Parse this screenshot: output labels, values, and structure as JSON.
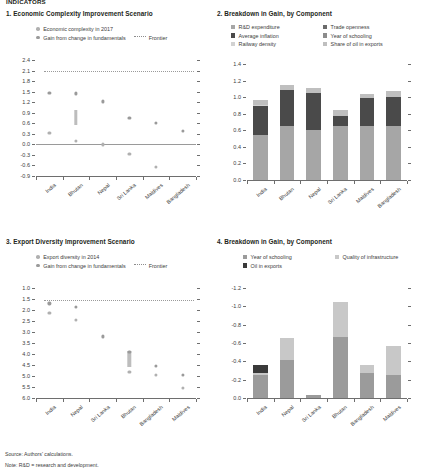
{
  "figure": {
    "top_title": "INDICATORS",
    "source": "Source: Authors' calculations.",
    "note": "Note: R&D = research and development."
  },
  "colors": {
    "complexity_dot": "#b0b0b0",
    "gain_dot": "#9a9a9a",
    "gain_bar": "#bdbdbd",
    "frontier": "#9a9a9a",
    "axis": "#6e6e6e",
    "text": "#3c3c3c",
    "rd_expenditure": "#a6a6a6",
    "average_inflation": "#4a4a4a",
    "railway_density": "#d2d2d2",
    "trade_openness": "#6b6b6b",
    "year_of_schooling": "#8c8c8c",
    "share_of_oil_in_exports": "#bfbfbf",
    "p4_year_of_schooling": "#9b9b9b",
    "p4_quality_of_infrastructure": "#c8c8c8",
    "p4_oil_in_exports": "#3a3a3a"
  },
  "panel1": {
    "title": "1. Economic Complexity Improvement Scenario",
    "legend": [
      {
        "label": "Economic complexity in 2017",
        "marker": "dot"
      },
      {
        "label": "Gain from change in fundamentals",
        "marker": "dot"
      },
      {
        "label": "Frontier",
        "marker": "dashed-line"
      }
    ],
    "chart_data": {
      "type": "scatter",
      "title": "1. Economic Complexity Improvement Scenario",
      "xlabel": "",
      "ylabel": "",
      "ylim": [
        -0.9,
        2.4
      ],
      "yticks": [
        "2.4",
        "2.1",
        "1.8",
        "1.5",
        "1.2",
        "0.9",
        "0.6",
        "0.3",
        "0.0",
        "-0.3",
        "-0.6",
        "-0.9"
      ],
      "grid": false,
      "frontier_value": 2.1,
      "categories": [
        "India",
        "Bhutan",
        "Nepal",
        "Sri Lanka",
        "Maldives",
        "Bangladesh"
      ],
      "series": [
        {
          "name": "Economic complexity in 2017",
          "values": [
            0.32,
            0.1,
            0.0,
            -0.27,
            -0.65,
            null
          ]
        },
        {
          "name": "Gain from change in fundamentals",
          "values": [
            1.47,
            1.45,
            1.22,
            0.75,
            0.6,
            0.38
          ]
        }
      ],
      "gain_range_bars": [
        {
          "category": "Bhutan",
          "low": 0.55,
          "high": 0.97
        }
      ]
    }
  },
  "panel2": {
    "title": "2. Breakdown in Gain, by Component",
    "legend": [
      {
        "label": "R&D expenditure",
        "color_key": "rd_expenditure"
      },
      {
        "label": "Trade openness",
        "color_key": "trade_openness"
      },
      {
        "label": "Average inflation",
        "color_key": "average_inflation"
      },
      {
        "label": "Year of schooling",
        "color_key": "year_of_schooling"
      },
      {
        "label": "Railway density",
        "color_key": "railway_density"
      },
      {
        "label": "Share of oil in exports",
        "color_key": "share_of_oil_in_exports"
      }
    ],
    "chart_data": {
      "type": "bar",
      "title": "2. Breakdown in Gain, by Component",
      "stacked": true,
      "xlabel": "",
      "ylabel": "",
      "ylim": [
        0.0,
        1.4
      ],
      "yticks": [
        "1.4",
        "1.2",
        "1.0",
        "0.8",
        "0.6",
        "0.4",
        "0.2",
        "0.0"
      ],
      "grid": false,
      "categories": [
        "India",
        "Bhutan",
        "Nepal",
        "Sri Lanka",
        "Maldives",
        "Bangladesh"
      ],
      "series": [
        {
          "name": "R&D expenditure",
          "color_key": "rd_expenditure",
          "values": [
            0.545,
            0.65,
            0.605,
            0.65,
            0.65,
            0.655
          ]
        },
        {
          "name": "Average inflation",
          "color_key": "average_inflation",
          "values": [
            0.345,
            0.44,
            0.45,
            0.125,
            0.335,
            0.345
          ]
        },
        {
          "name": "Railway density",
          "color_key": "railway_density",
          "values": [
            0.02,
            0.0,
            0.0,
            0.0,
            0.0,
            0.0
          ]
        },
        {
          "name": "Trade openness",
          "color_key": "trade_openness",
          "values": [
            0.0,
            0.0,
            0.0,
            0.0,
            0.0,
            0.0
          ]
        },
        {
          "name": "Year of schooling",
          "color_key": "year_of_schooling",
          "values": [
            0.0,
            0.0,
            0.0,
            0.0,
            0.0,
            0.0
          ]
        },
        {
          "name": "Share of oil in exports",
          "color_key": "share_of_oil_in_exports",
          "values": [
            0.06,
            0.06,
            0.055,
            0.065,
            0.055,
            0.07
          ]
        }
      ],
      "totals": [
        0.97,
        1.15,
        1.11,
        0.84,
        1.04,
        1.07
      ]
    }
  },
  "panel3": {
    "title": "3. Export Diversity Improvement Scenario",
    "legend": [
      {
        "label": "Export diversity in 2014",
        "marker": "dot"
      },
      {
        "label": "Gain from change in fundamentals",
        "marker": "dot"
      },
      {
        "label": "Frontier",
        "marker": "dashed-line"
      }
    ],
    "chart_data": {
      "type": "scatter",
      "title": "3. Export Diversity Improvement Scenario",
      "xlabel": "",
      "ylabel": "",
      "ylim": [
        1.0,
        6.0
      ],
      "y_inverted": true,
      "yticks": [
        "1.0",
        "1.5",
        "2.0",
        "2.5",
        "3.0",
        "3.5",
        "4.0",
        "4.5",
        "5.0",
        "5.5",
        "6.0"
      ],
      "grid": false,
      "frontier_value": 1.55,
      "categories": [
        "India",
        "Nepal",
        "Sri Lanka",
        "Bhutan",
        "Bangladesh",
        "Maldives"
      ],
      "series": [
        {
          "name": "Export diversity in 2014",
          "values": [
            2.15,
            2.45,
            null,
            4.8,
            4.95,
            5.55
          ]
        },
        {
          "name": "Gain from change in fundamentals",
          "values": [
            1.7,
            1.85,
            3.2,
            3.9,
            4.55,
            4.95
          ]
        }
      ],
      "gain_range_bars": [
        {
          "category": "Bhutan",
          "low": 3.85,
          "high": 4.6
        }
      ]
    }
  },
  "panel4": {
    "title": "4. Breakdown in Gain, by Component",
    "legend": [
      {
        "label": "Year of schooling",
        "color_key": "p4_year_of_schooling"
      },
      {
        "label": "Quality of infrastructure",
        "color_key": "p4_quality_of_infrastructure"
      },
      {
        "label": "Oil in exports",
        "color_key": "p4_oil_in_exports"
      }
    ],
    "chart_data": {
      "type": "bar",
      "title": "4. Breakdown in Gain, by Component",
      "stacked": true,
      "xlabel": "",
      "ylabel": "",
      "ylim": [
        -1.2,
        0.0
      ],
      "y_inverted": true,
      "yticks": [
        "-1.2",
        "-1.0",
        "-0.8",
        "-0.6",
        "-0.4",
        "-0.2",
        "0.0"
      ],
      "grid": false,
      "categories": [
        "India",
        "Nepal",
        "Sri Lanka",
        "Bhutan",
        "Bangladesh",
        "Maldives"
      ],
      "series": [
        {
          "name": "Year of schooling",
          "color_key": "p4_year_of_schooling",
          "values": [
            -0.255,
            -0.415,
            -0.03,
            -0.665,
            -0.27,
            -0.255
          ]
        },
        {
          "name": "Quality of infrastructure",
          "color_key": "p4_quality_of_infrastructure",
          "values": [
            -0.02,
            -0.24,
            0.0,
            -0.38,
            -0.085,
            -0.315
          ]
        },
        {
          "name": "Oil in exports",
          "color_key": "p4_oil_in_exports",
          "values": [
            -0.085,
            0.0,
            0.0,
            0.0,
            0.0,
            0.0
          ]
        }
      ],
      "totals": [
        -0.36,
        -0.655,
        -0.03,
        -1.045,
        -0.355,
        -0.57
      ]
    }
  }
}
